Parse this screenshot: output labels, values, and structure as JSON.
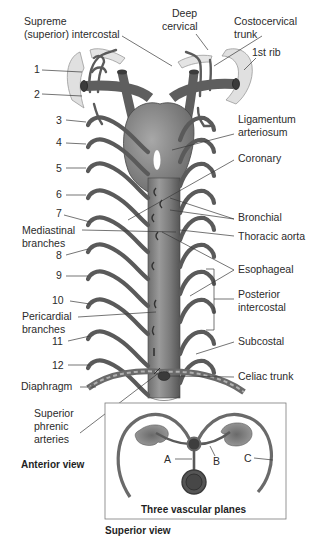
{
  "figure": {
    "view_labels": {
      "anterior": "Anterior view",
      "superior": "Superior view"
    },
    "left_labels": {
      "supreme_intercostal_line1": "Supreme",
      "supreme_intercostal_line2": "(superior) intercostal",
      "mediastinal_line1": "Mediastinal",
      "mediastinal_line2": "branches",
      "pericardial_line1": "Pericardial",
      "pericardial_line2": "branches",
      "diaphragm": "Diaphragm",
      "superior_phrenic_line1": "Superior",
      "superior_phrenic_line2": "phrenic",
      "superior_phrenic_line3": "arteries"
    },
    "rib_numbers": [
      "1",
      "2",
      "3",
      "4",
      "5",
      "6",
      "7",
      "8",
      "9",
      "10",
      "11",
      "12"
    ],
    "right_labels": {
      "deep_cervical_line1": "Deep",
      "deep_cervical_line2": "cervical",
      "costocervical_line1": "Costocervical",
      "costocervical_line2": "trunk",
      "first_rib": "1st rib",
      "ligamentum_line1": "Ligamentum",
      "ligamentum_line2": "arteriosum",
      "coronary": "Coronary",
      "bronchial": "Bronchial",
      "thoracic_aorta": "Thoracic aorta",
      "esophageal": "Esophageal",
      "posterior_intercostal_line1": "Posterior",
      "posterior_intercostal_line2": "intercostal",
      "subcostal": "Subcostal",
      "celiac_trunk": "Celiac trunk"
    },
    "inset": {
      "title": "Three vascular planes",
      "plane_labels": [
        "A",
        "B",
        "C"
      ]
    }
  }
}
